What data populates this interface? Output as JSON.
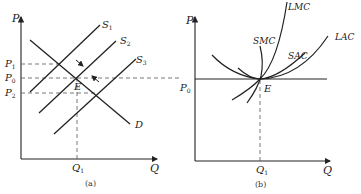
{
  "panels": [
    {
      "id": "a",
      "caption": "(a)",
      "axes": {
        "y_label": "P",
        "x_label": "Q"
      },
      "price_levels": [
        {
          "label": "P",
          "sub": "1"
        },
        {
          "label": "P",
          "sub": "0"
        },
        {
          "label": "P",
          "sub": "2"
        }
      ],
      "quantity_levels": [
        {
          "label": "Q",
          "sub": "1"
        }
      ],
      "curves": [
        {
          "label": "S",
          "sub": "1"
        },
        {
          "label": "S",
          "sub": "2"
        },
        {
          "label": "S",
          "sub": "3"
        },
        {
          "label": "D",
          "sub": ""
        }
      ],
      "point_label": "E"
    },
    {
      "id": "b",
      "caption": "(b)",
      "axes": {
        "y_label": "P",
        "x_label": "Q"
      },
      "price_levels": [
        {
          "label": "P",
          "sub": "0"
        }
      ],
      "quantity_levels": [
        {
          "label": "Q",
          "sub": "1"
        }
      ],
      "curves": [
        {
          "label": "LMC"
        },
        {
          "label": "SMC"
        },
        {
          "label": "SAC"
        },
        {
          "label": "LAC"
        }
      ],
      "point_label": "E"
    }
  ],
  "colors": {
    "line": "#2a2a2a",
    "dashed": "#555555",
    "background": "#ffffff"
  }
}
